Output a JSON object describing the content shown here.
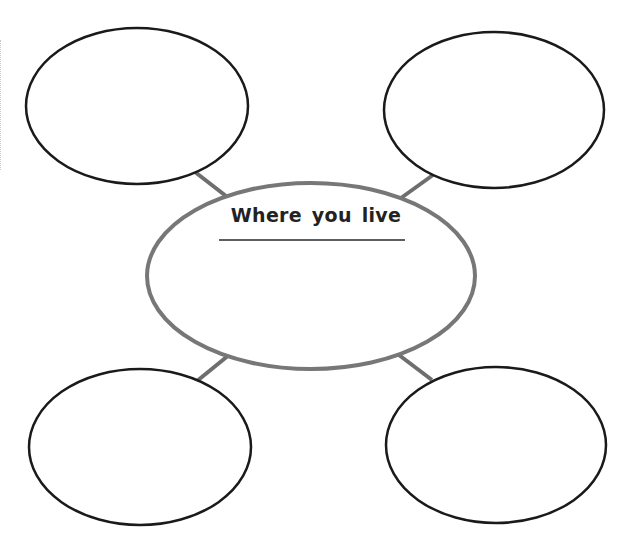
{
  "diagram": {
    "title": "Where you live",
    "type": "web-organizer",
    "colors": {
      "outer_stroke": "#1a1a1a",
      "center_stroke": "#777777",
      "connector": "#6e6e6e",
      "underline": "#2a2a2a",
      "background": "#ffffff"
    },
    "center": {
      "label": "Where you live",
      "cx": 311,
      "cy": 276,
      "rx": 164,
      "ry": 93
    },
    "outer_nodes": [
      {
        "position": "top-left",
        "label": "",
        "cx": 137,
        "cy": 106,
        "rx": 111,
        "ry": 78
      },
      {
        "position": "top-right",
        "label": "",
        "cx": 494,
        "cy": 110,
        "rx": 110,
        "ry": 78
      },
      {
        "position": "bottom-left",
        "label": "",
        "cx": 140,
        "cy": 447,
        "rx": 111,
        "ry": 78
      },
      {
        "position": "bottom-right",
        "label": "",
        "cx": 496,
        "cy": 445,
        "rx": 110,
        "ry": 78
      }
    ]
  }
}
